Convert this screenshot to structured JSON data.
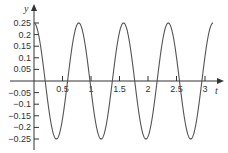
{
  "chart_data": {
    "type": "line",
    "title": "",
    "xlabel": "t",
    "ylabel": "y",
    "function": "y = 0.25 cos(8t)",
    "xlim": [
      0,
      3.1416
    ],
    "ylim": [
      -0.25,
      0.25
    ],
    "grid": false,
    "legend": null,
    "x_ticks": [
      0.5,
      1,
      1.5,
      2,
      2.5,
      3
    ],
    "x_tick_labels": [
      "0.5",
      "1",
      "1.5",
      "2",
      "2.5",
      "3"
    ],
    "y_ticks": [
      0.25,
      0.2,
      0.15,
      0.1,
      0.05,
      -0.05,
      -0.1,
      -0.15,
      -0.2,
      -0.25
    ],
    "y_tick_labels": [
      "0.25",
      "0.2",
      "0.15",
      "0.1",
      "0.05",
      "−0.05",
      "−0.1",
      "−0.15",
      "−0.2",
      "−0.25"
    ],
    "series": [
      {
        "name": "y(t)",
        "amplitude": 0.25,
        "angular_frequency": 8,
        "period": 0.785,
        "x": [
          0,
          0.393,
          0.785,
          1.178,
          1.571,
          1.963,
          2.356,
          2.749,
          3.142
        ],
        "values": [
          0.25,
          -0.25,
          0.25,
          -0.25,
          0.25,
          -0.25,
          0.25,
          -0.25,
          0.25
        ]
      }
    ],
    "colors": {
      "curve": "#555555",
      "axes": "#333333"
    }
  }
}
